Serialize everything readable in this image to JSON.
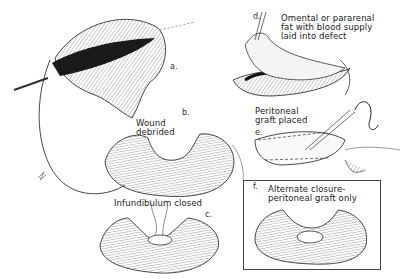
{
  "figure": {
    "panels": [
      {
        "id": "a",
        "letter": "a.",
        "caption": ""
      },
      {
        "id": "b",
        "letter": "b.",
        "caption": "Wound\ndebrided"
      },
      {
        "id": "c",
        "letter": "c.",
        "caption": "Infundibulum closed"
      },
      {
        "id": "d",
        "letter": "d.",
        "caption": "Omental or pararenal\nfat with blood supply\nlaid into defect"
      },
      {
        "id": "e",
        "letter": "e.",
        "caption": "Peritoneal\ngraft placed"
      },
      {
        "id": "f",
        "letter": "f.",
        "caption": "Alternate closure-\nperitoneal graft only"
      }
    ],
    "colors": {
      "ink": "#222222",
      "background": "#ffffff",
      "hatch": "#555555"
    }
  }
}
